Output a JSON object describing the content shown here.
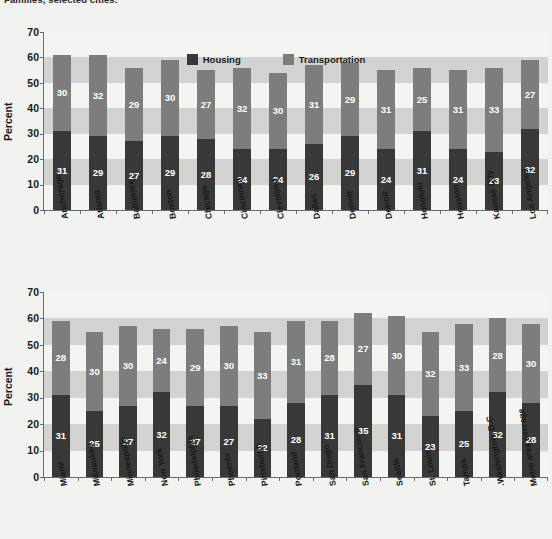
{
  "document": {
    "title": "Families, selected cities."
  },
  "legend": {
    "items": [
      {
        "label": "Housing",
        "color": "#383838"
      },
      {
        "label": "Transportation",
        "color": "#7d7d7d"
      }
    ]
  },
  "axis": {
    "ylabel": "Percent",
    "yticks": [
      0,
      10,
      20,
      30,
      40,
      50,
      60,
      70
    ],
    "ymin": 0,
    "ymax": 70
  },
  "chart_data": [
    {
      "type": "bar",
      "stacked": true,
      "title": "Families, selected cities.",
      "xlabel": "",
      "ylabel": "Percent",
      "ylim": [
        0,
        70
      ],
      "grid": "horizontal-bands",
      "legend_position": "top-center",
      "categories": [
        "Anchorage",
        "Atlanta",
        "Baltimore",
        "Boston",
        "Chicago",
        "Cincinnati",
        "Cleveland",
        "Dallas",
        "Denver",
        "Detroit",
        "Honolulu",
        "Houston",
        "Kansas City",
        "Los Angeles"
      ],
      "series": [
        {
          "name": "Housing",
          "color": "#383838",
          "values": [
            31,
            29,
            27,
            29,
            28,
            24,
            24,
            26,
            29,
            24,
            31,
            24,
            23,
            32
          ]
        },
        {
          "name": "Transportation",
          "color": "#7d7d7d",
          "values": [
            30,
            32,
            29,
            30,
            27,
            32,
            30,
            31,
            29,
            31,
            25,
            31,
            33,
            27
          ]
        }
      ],
      "totals": [
        61,
        61,
        56,
        59,
        55,
        56,
        54,
        57,
        58,
        55,
        56,
        55,
        56,
        59
      ]
    },
    {
      "type": "bar",
      "stacked": true,
      "title": "",
      "xlabel": "",
      "ylabel": "Percent",
      "ylim": [
        0,
        70
      ],
      "grid": "horizontal-bands",
      "legend_position": "none",
      "categories": [
        "Miami",
        "Milwaukee",
        "Minneapolis",
        "New York",
        "Philadelphia",
        "Phoenix",
        "Pittsburgh",
        "Portland",
        "San Diego",
        "San Francisco",
        "Seattle",
        "St. Louis",
        "Tampa",
        "Washington, D.C.",
        "Metro area average"
      ],
      "series": [
        {
          "name": "Housing",
          "color": "#383838",
          "values": [
            31,
            25,
            27,
            32,
            27,
            27,
            22,
            28,
            31,
            35,
            31,
            23,
            25,
            32,
            28
          ]
        },
        {
          "name": "Transportation",
          "color": "#7d7d7d",
          "values": [
            28,
            30,
            30,
            24,
            29,
            30,
            33,
            31,
            28,
            27,
            30,
            32,
            33,
            28,
            30
          ]
        }
      ],
      "totals": [
        59,
        55,
        57,
        56,
        56,
        57,
        55,
        59,
        59,
        62,
        61,
        55,
        58,
        60,
        58
      ]
    }
  ]
}
